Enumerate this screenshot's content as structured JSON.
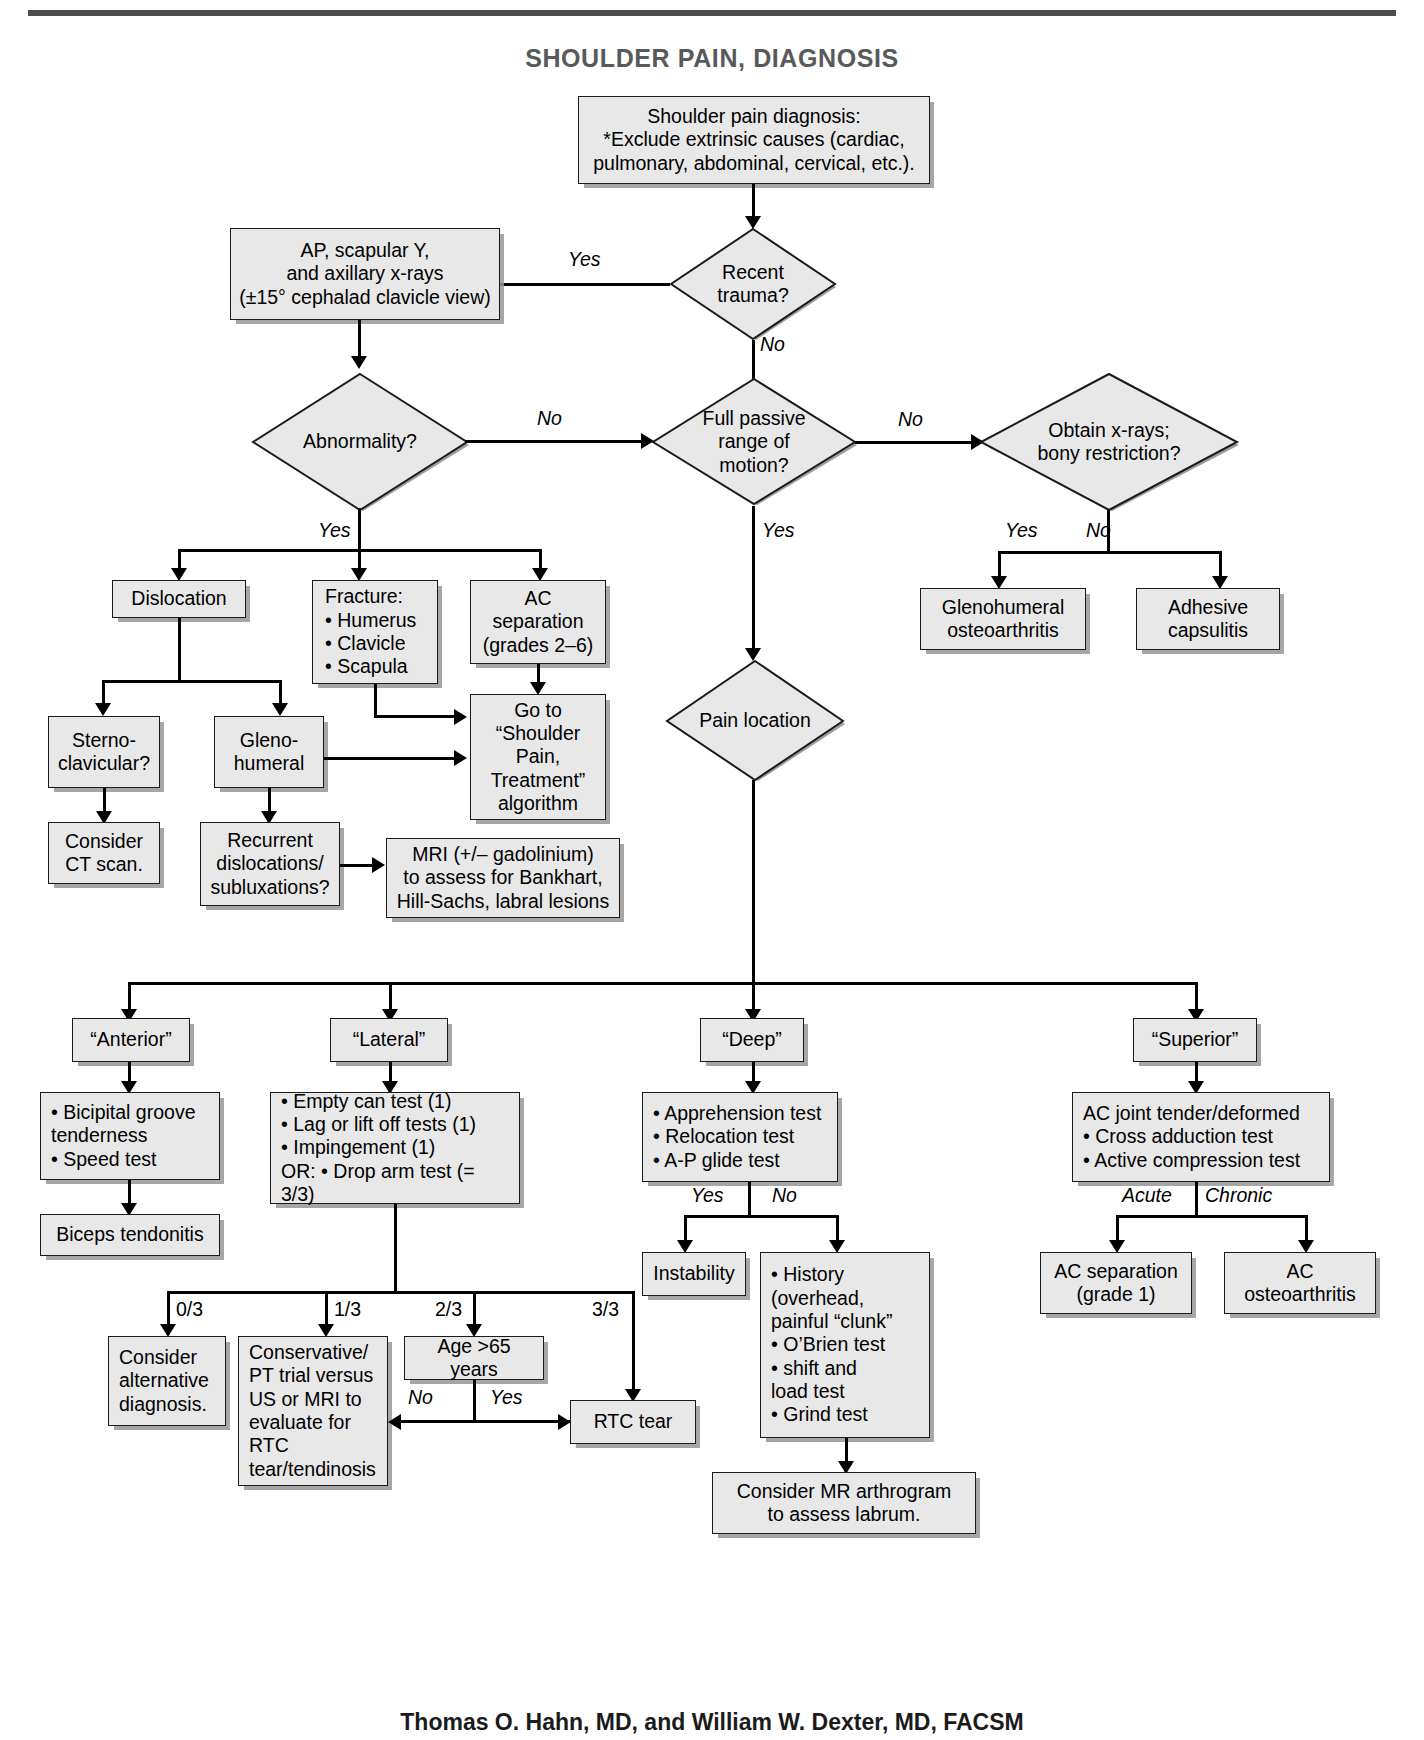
{
  "title": "SHOULDER PAIN, DIAGNOSIS",
  "caption": "Thomas O. Hahn, MD, and William W. Dexter, MD, FACSM",
  "colors": {
    "node_fill": "#e8e8e8",
    "node_border": "#1a1a1a",
    "title_color": "#58595b",
    "line_color": "#000000"
  },
  "nodes": {
    "start": "Shoulder pain diagnosis:\n*Exclude extrinsic causes (cardiac,\npulmonary, abdominal, cervical, etc.).",
    "recent_trauma": "Recent\ntrauma?",
    "xrays": "AP, scapular Y,\nand axillary x-rays\n(±15° cephalad clavicle view)",
    "abnormality": "Abnormality?",
    "full_passive_rom": "Full passive\nrange of\nmotion?",
    "obtain_xrays": "Obtain x-rays;\nbony restriction?",
    "glenohumeral_oa": "Glenohumeral\nosteoarthritis",
    "adhesive_capsulitis": "Adhesive\ncapsulitis",
    "dislocation": "Dislocation",
    "fracture": "Fracture:\n• Humerus\n• Clavicle\n• Scapula",
    "ac_separation_26": "AC\nseparation\n(grades 2–6)",
    "goto_treatment": "Go to\n“Shoulder\nPain,\nTreatment”\nalgorithm",
    "sternoclavicular": "Sterno-\nclavicular?",
    "glenohumeral": "Gleno-\nhumeral",
    "consider_ct": "Consider\nCT scan.",
    "recurrent_dislocations": "Recurrent\ndislocations/\nsubluxations?",
    "mri_gadolinium": "MRI (+/– gadolinium)\nto assess for Bankhart,\nHill-Sachs, labral lesions",
    "pain_location": "Pain location",
    "anterior": "“Anterior”",
    "lateral": "“Lateral”",
    "deep": "“Deep”",
    "superior": "“Superior”",
    "anterior_tests": "• Bicipital groove\n   tenderness\n• Speed test",
    "lateral_tests": "• Empty can test (1)\n• Lag or lift off tests (1)\n• Impingement (1)\nOR: • Drop arm test (= 3/3)",
    "deep_tests": "• Apprehension test\n• Relocation test\n• A-P glide test",
    "superior_tests": "AC joint tender/deformed\n • Cross adduction test\n • Active compression test",
    "biceps_tendonitis": "Biceps tendonitis",
    "instability": "Instability",
    "history_box": "• History\n   (overhead,\n   painful “clunk”\n• O’Brien test\n• shift and\n   load test\n• Grind test",
    "consider_mr_arthrogram": "Consider MR arthrogram\nto assess labrum.",
    "ac_separation_g1": "AC separation\n(grade 1)",
    "ac_osteoarthritis": "AC\nosteoarthritis",
    "consider_alternative": "Consider\nalternative\ndiagnosis.",
    "conservative_pt": "Conservative/\nPT trial versus\nUS or MRI to\nevaluate for RTC\ntear/tendinosis",
    "age_65": "Age >65 years",
    "rtc_tear": "RTC tear"
  },
  "edge_labels": {
    "trauma_yes": "Yes",
    "trauma_no": "No",
    "abnormality_no": "No",
    "abnormality_yes": "Yes",
    "rom_no": "No",
    "rom_yes": "Yes",
    "bony_yes": "Yes",
    "bony_no": "No",
    "deep_yes": "Yes",
    "deep_no": "No",
    "superior_acute": "Acute",
    "superior_chronic": "Chronic",
    "age_no": "No",
    "age_yes": "Yes",
    "score_0": "0/3",
    "score_1": "1/3",
    "score_2": "2/3",
    "score_3": "3/3"
  }
}
